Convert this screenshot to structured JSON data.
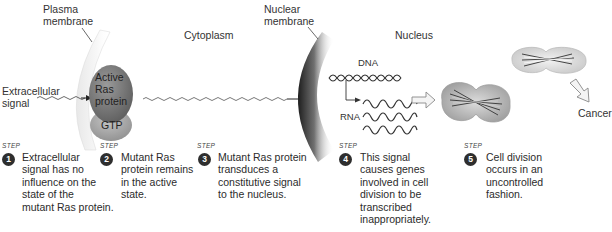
{
  "labels": {
    "plasma_membrane": "Plasma\nmembrane",
    "plasma_line1": "Plasma",
    "plasma_line2": "membrane",
    "cytoplasm": "Cytoplasm",
    "nuclear_line1": "Nuclear",
    "nuclear_line2": "membrane",
    "nucleus": "Nucleus",
    "extracellular_line1": "Extracellular",
    "extracellular_line2": "signal",
    "dna": "DNA",
    "rna": "RNA",
    "cancer": "Cancer"
  },
  "protein": {
    "active_line1": "Active",
    "active_line2": "Ras",
    "active_line3": "protein",
    "gtp": "GTP"
  },
  "step_tag": "STEP",
  "steps": [
    {
      "number": "1",
      "text": "Extracellular\nsignal has no\ninfluence on the\nstate of the\nmutant Ras protein."
    },
    {
      "number": "2",
      "text": "Mutant Ras\nprotein remains\nin the active\nstate."
    },
    {
      "number": "3",
      "text": "Mutant Ras protein\ntransduces a\nconstitutive signal\nto the nucleus."
    },
    {
      "number": "4",
      "text": "This signal\ncauses genes\ninvolved in cell\ndivision to be\ntranscribed\ninappropriately."
    },
    {
      "number": "5",
      "text": "Cell division\noccurs in an\nuncontrolled\nfashion."
    }
  ],
  "colors": {
    "protein_dark": "#6f6f6f",
    "protein_light": "#a9a9a9",
    "membrane_dark": "#2a2a2a",
    "cell_fill": "#d6d6d6",
    "step_badge": "#2e2e2e"
  }
}
